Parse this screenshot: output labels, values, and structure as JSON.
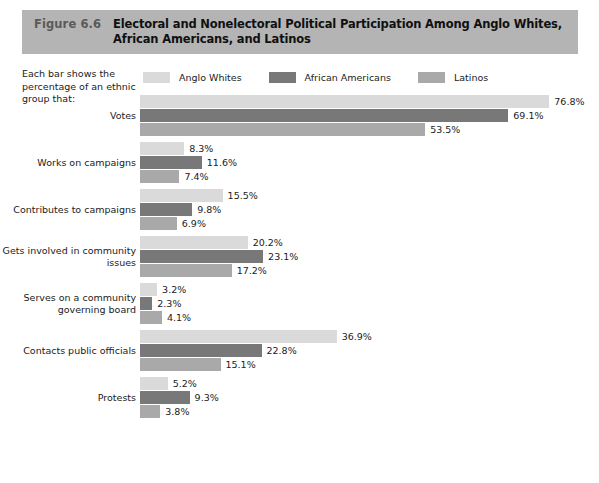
{
  "figure": {
    "number": "Figure 6.6",
    "title": "Electoral and Nonelectoral Political Participation Among Anglo Whites, African Americans, and Latinos",
    "banner_color": "#b4b4b4"
  },
  "intro_note": "Each bar shows the percentage of an ethnic group that:",
  "legend": {
    "items": [
      {
        "label": "Anglo Whites",
        "color": "#dadada"
      },
      {
        "label": "African Americans",
        "color": "#787878"
      },
      {
        "label": "Latinos",
        "color": "#a9a9a9"
      }
    ]
  },
  "chart_data": {
    "type": "bar",
    "orientation": "horizontal",
    "title": "Electoral and Nonelectoral Political Participation Among Anglo Whites, African Americans, and Latinos",
    "xlabel": "",
    "ylabel": "",
    "xlim": [
      0,
      76.8
    ],
    "grid": false,
    "legend_position": "top",
    "value_suffix": "%",
    "categories": [
      "Votes",
      "Works on campaigns",
      "Contributes to campaigns",
      "Gets involved in community issues",
      "Serves on a community governing board",
      "Contacts public officials",
      "Protests"
    ],
    "series": [
      {
        "name": "Anglo Whites",
        "color": "#dadada",
        "values": [
          76.8,
          8.3,
          15.5,
          20.2,
          3.2,
          36.9,
          5.2
        ],
        "labels": [
          "76.8%",
          "8.3%",
          "15.5%",
          "20.2%",
          "3.2%",
          "36.9%",
          "5.2%"
        ]
      },
      {
        "name": "African Americans",
        "color": "#787878",
        "values": [
          69.1,
          11.6,
          9.8,
          23.1,
          2.3,
          22.8,
          9.3
        ],
        "labels": [
          "69.1%",
          "11.6%",
          "9.8%",
          "23.1%",
          "2.3%",
          "22.8%",
          "9.3%"
        ]
      },
      {
        "name": "Latinos",
        "color": "#a9a9a9",
        "values": [
          53.5,
          7.4,
          6.9,
          17.2,
          4.1,
          15.1,
          3.8
        ],
        "labels": [
          "53.5%",
          "7.4%",
          "6.9%",
          "17.2%",
          "4.1%",
          "15.1%",
          "3.8%"
        ]
      }
    ]
  }
}
